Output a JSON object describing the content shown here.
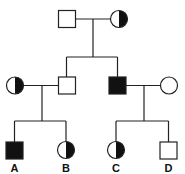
{
  "diagram": {
    "type": "pedigree-chart",
    "colors": {
      "stroke": "#222222",
      "fill_affected": "#111111",
      "background": "#ffffff"
    },
    "generations": [
      {
        "id": "I",
        "members": [
          {
            "id": "I-1",
            "sex": "male",
            "status": "unaffected"
          },
          {
            "id": "I-2",
            "sex": "female",
            "status": "carrier"
          }
        ]
      },
      {
        "id": "II",
        "members": [
          {
            "id": "II-1",
            "sex": "female",
            "status": "carrier",
            "note": "married in"
          },
          {
            "id": "II-2",
            "sex": "male",
            "status": "unaffected"
          },
          {
            "id": "II-3",
            "sex": "male",
            "status": "affected"
          },
          {
            "id": "II-4",
            "sex": "female",
            "status": "unaffected",
            "note": "married in"
          }
        ]
      },
      {
        "id": "III",
        "members": [
          {
            "id": "III-1",
            "label": "A",
            "sex": "male",
            "status": "affected"
          },
          {
            "id": "III-2",
            "label": "B",
            "sex": "female",
            "status": "carrier"
          },
          {
            "id": "III-3",
            "label": "C",
            "sex": "female",
            "status": "carrier"
          },
          {
            "id": "III-4",
            "label": "D",
            "sex": "male",
            "status": "unaffected"
          }
        ]
      }
    ],
    "labels": {
      "A": "A",
      "B": "B",
      "C": "C",
      "D": "D"
    }
  }
}
